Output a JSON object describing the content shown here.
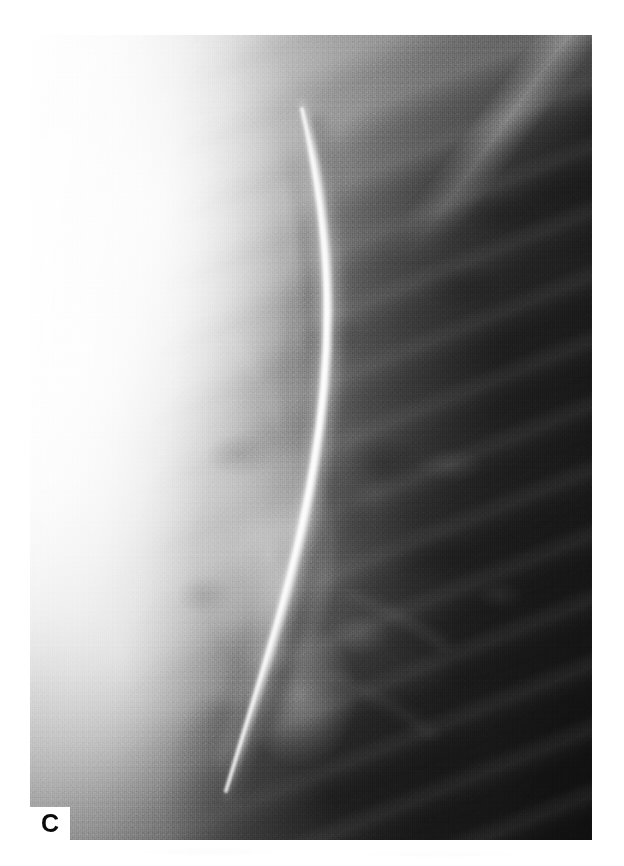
{
  "figure": {
    "panel_label": "C",
    "modality": "chest radiograph",
    "view": "coned-down lateral chest film",
    "background_color": "#ffffff",
    "film_colors": {
      "highlight": "#ffffff",
      "midtone": "#949494",
      "shadow": "#1b1b1b",
      "label_color": "#0a0a0a"
    },
    "plate": {
      "left": 30,
      "top": 35,
      "width": 562,
      "height": 805
    },
    "notch": {
      "left": 30,
      "top": 807,
      "width": 40,
      "height": 33
    }
  },
  "ghost_text": {
    "note": "faint illegible bleed-through of text from the reverse side of the printed page",
    "lines": [
      "",
      "",
      ""
    ]
  }
}
